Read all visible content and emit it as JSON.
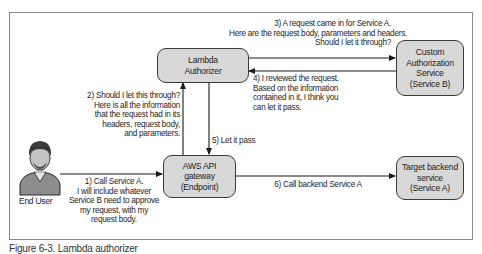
{
  "diagram": {
    "nodes": {
      "lambda_authorizer": {
        "lines": [
          "Lambda",
          "Authorizer"
        ]
      },
      "custom_auth_service": {
        "lines": [
          "Custom",
          "Authorization",
          "Service",
          "(Service B)"
        ]
      },
      "api_gateway": {
        "lines": [
          "AWS API",
          "gateway",
          "(Endpoint)"
        ]
      },
      "target_backend": {
        "lines": [
          "Target backend",
          "service",
          "(Service A)"
        ]
      },
      "end_user": {
        "label": "End User"
      }
    },
    "edges": {
      "step1": {
        "lines": [
          "1) Call Service A.",
          "I will include whatever",
          "Service B need to approve",
          "my request, with my",
          "request body."
        ]
      },
      "step2": {
        "lines": [
          "2) Should I let this through?",
          "Here is all the information",
          "that the request had in its",
          "headers, request body,",
          "and parameters."
        ]
      },
      "step3": {
        "lines": [
          "3) A request came in for Service A.",
          "Here are the request body, parameters and headers.",
          "Should I let it through?"
        ]
      },
      "step4": {
        "lines": [
          "4) I reviewed the request.",
          "Based on the information",
          "contained in it, I think you",
          "can let it pass."
        ]
      },
      "step5": {
        "label": "5) Let it pass"
      },
      "step6": {
        "label": "6) Call backend Service A"
      }
    },
    "colors": {
      "node_fill": "#d8d8d8",
      "node_border": "#3a3a3a",
      "arrow": "#1a1a1a",
      "frame_border": "#8a8a8a"
    }
  },
  "caption": "Figure 6-3. Lambda authorizer"
}
